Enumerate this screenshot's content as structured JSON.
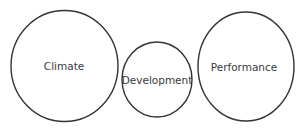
{
  "diagram": {
    "stroke_color": "#333333",
    "text_color": "#3a3a3a",
    "nodes": [
      {
        "id": "climate",
        "label": "Climate",
        "cx": 64.5,
        "cy": 66,
        "rx": 53.5,
        "ry": 55.5
      },
      {
        "id": "development",
        "label": "Development",
        "cx": 157,
        "cy": 79.5,
        "rx": 35,
        "ry": 37.5
      },
      {
        "id": "performance",
        "label": "Performance",
        "cx": 246,
        "cy": 66.5,
        "rx": 48,
        "ry": 54.5
      }
    ]
  }
}
